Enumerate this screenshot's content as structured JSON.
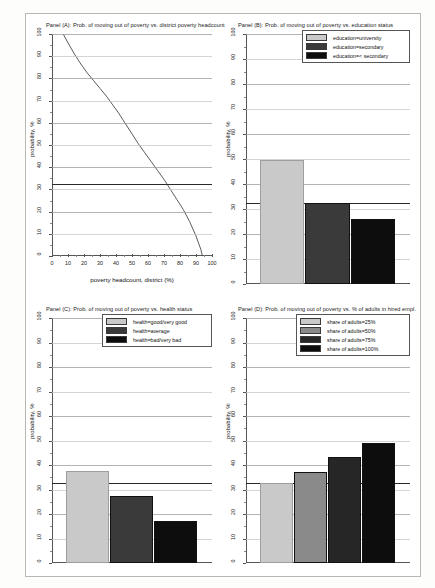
{
  "figure": {
    "panel_count": 4,
    "bg_color": "#ffffff",
    "frame_color": "#b9b9b4"
  },
  "chart_data": [
    {
      "id": "panel-a",
      "type": "line",
      "title": "Panel (A): Prob. of moving out of poverty vs. district poverty headcount",
      "xlabel": "poverty headcount, district (%)",
      "ylabel": "probability, %",
      "xlim": [
        0,
        100
      ],
      "ylim": [
        0,
        100
      ],
      "xticks": [
        0,
        10,
        20,
        30,
        40,
        50,
        60,
        70,
        80,
        90,
        100
      ],
      "yticks": [
        0,
        10,
        20,
        30,
        40,
        50,
        60,
        70,
        80,
        90,
        100
      ],
      "grid": true,
      "reference_line_y": 32.5,
      "series": [
        {
          "name": "predicted probability",
          "color": "#4a4a4a",
          "x": [
            7,
            10,
            14,
            18,
            22,
            26,
            30,
            34,
            38,
            42,
            46,
            50,
            54,
            58,
            62,
            66,
            70,
            74,
            78,
            82,
            86,
            90,
            93,
            94
          ],
          "y": [
            100,
            96,
            91,
            86.5,
            82.5,
            79,
            75.5,
            72,
            68,
            64,
            59.5,
            55,
            50.5,
            46.5,
            42.5,
            38.5,
            34.5,
            30,
            25.5,
            21,
            15.5,
            9,
            3,
            0
          ]
        }
      ]
    },
    {
      "id": "panel-b",
      "type": "bar",
      "title": "Panel (B): Prob. of moving out of poverty vs. education status",
      "xlabel": "",
      "ylabel": "probability, %",
      "ylim": [
        0,
        100
      ],
      "yticks": [
        0,
        10,
        20,
        30,
        40,
        50,
        60,
        70,
        80,
        90,
        100
      ],
      "grid": true,
      "reference_line_y": 32.5,
      "legend_position": "top-right",
      "categories": [
        "education=university",
        "education=secondary",
        "education=< secondary"
      ],
      "values": [
        49.5,
        32.5,
        26.0
      ],
      "colors": [
        "#c9c9c9",
        "#3a3a3a",
        "#0d0d0d"
      ]
    },
    {
      "id": "panel-c",
      "type": "bar",
      "title": "Panel (C): Prob. of moving out of poverty vs. health status",
      "xlabel": "",
      "ylabel": "probability, %",
      "ylim": [
        0,
        100
      ],
      "yticks": [
        0,
        10,
        20,
        30,
        40,
        50,
        60,
        70,
        80,
        90,
        100
      ],
      "grid": true,
      "reference_line_y": 32.5,
      "legend_position": "top-right",
      "categories": [
        "health=good/very good",
        "health=average",
        "health=bad/very bad"
      ],
      "values": [
        37.5,
        27.5,
        17.2
      ],
      "colors": [
        "#c9c9c9",
        "#3a3a3a",
        "#0d0d0d"
      ]
    },
    {
      "id": "panel-d",
      "type": "bar",
      "title": "Panel (D): Prob. of moving out of poverty vs. % of adults in hired empl.",
      "xlabel": "",
      "ylabel": "probability, %",
      "ylim": [
        0,
        100
      ],
      "yticks": [
        0,
        10,
        20,
        30,
        40,
        50,
        60,
        70,
        80,
        90,
        100
      ],
      "grid": true,
      "reference_line_y": 32.5,
      "legend_position": "top-right",
      "categories": [
        "share of adults=25%",
        "share of adults=50%",
        "share of adults=75%",
        "share of adults=100%"
      ],
      "values": [
        32.6,
        37.0,
        43.2,
        48.8
      ],
      "colors": [
        "#c9c9c9",
        "#8a8a8a",
        "#262626",
        "#0d0d0d"
      ]
    }
  ],
  "panelA": {
    "title": "Panel (A): Prob. of moving out of poverty vs. district poverty headcount",
    "ytitle": "probability, %",
    "xtitle": "poverty headcount, district (%)",
    "ytick_labels": [
      "0",
      "10",
      "20",
      "30",
      "40",
      "50",
      "60",
      "70",
      "80",
      "90",
      "100"
    ],
    "xtick_labels": [
      "0",
      "10",
      "20",
      "30",
      "40",
      "50",
      "60",
      "70",
      "80",
      "90",
      "100"
    ]
  },
  "panelB": {
    "title": "Panel (B): Prob. of moving out of poverty vs. education status",
    "ytitle": "probability, %",
    "ytick_labels": [
      "0",
      "10",
      "20",
      "30",
      "40",
      "50",
      "60",
      "70",
      "80",
      "90",
      "100"
    ],
    "legend": [
      {
        "label": "education=university",
        "color": "#c9c9c9"
      },
      {
        "label": "education=secondary",
        "color": "#3a3a3a"
      },
      {
        "label": "education=< secondary",
        "color": "#0d0d0d"
      }
    ]
  },
  "panelC": {
    "title": "Panel (C): Prob. of moving out of poverty vs. health status",
    "ytitle": "probability, %",
    "ytick_labels": [
      "0",
      "10",
      "20",
      "30",
      "40",
      "50",
      "60",
      "70",
      "80",
      "90",
      "100"
    ],
    "legend": [
      {
        "label": "health=good/very good",
        "color": "#c9c9c9"
      },
      {
        "label": "health=average",
        "color": "#3a3a3a"
      },
      {
        "label": "health=bad/very bad",
        "color": "#0d0d0d"
      }
    ]
  },
  "panelD": {
    "title": "Panel (D): Prob. of moving out of poverty vs. % of adults in hired empl.",
    "ytitle": "probability, %",
    "ytick_labels": [
      "0",
      "10",
      "20",
      "30",
      "40",
      "50",
      "60",
      "70",
      "80",
      "90",
      "100"
    ],
    "legend": [
      {
        "label": "share of adults=25%",
        "color": "#c9c9c9"
      },
      {
        "label": "share of adults=50%",
        "color": "#8a8a8a"
      },
      {
        "label": "share of adults=75%",
        "color": "#262626"
      },
      {
        "label": "share of adults=100%",
        "color": "#0d0d0d"
      }
    ]
  }
}
